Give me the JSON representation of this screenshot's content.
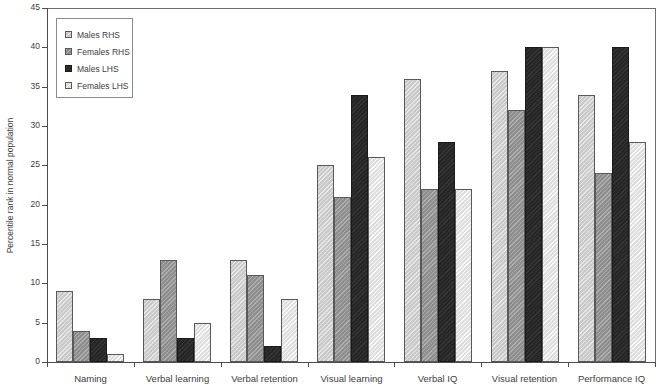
{
  "chart_data": {
    "type": "bar",
    "title": "",
    "subtitle": "",
    "xlabel": "",
    "ylabel": "Percentile rank in normal population",
    "ylim": [
      0,
      45
    ],
    "ytick_labels": [
      "0",
      "5",
      "10",
      "15",
      "20",
      "25",
      "30",
      "35",
      "40",
      "45"
    ],
    "ytick_values": [
      0,
      5,
      10,
      15,
      20,
      25,
      30,
      35,
      40,
      45
    ],
    "grid": false,
    "legend_position": "top-left",
    "categories": [
      "Naming",
      "Verbal learning",
      "Verbal retention",
      "Visual learning",
      "Verbal IQ",
      "Visual retention",
      "Performance IQ"
    ],
    "series": [
      {
        "name": "Males RHS",
        "color": "#c9c9c9",
        "values": [
          9,
          8,
          13,
          25,
          36,
          37,
          34
        ]
      },
      {
        "name": "Females RHS",
        "color": "#8d8d8d",
        "values": [
          4,
          13,
          11,
          21,
          22,
          32,
          24
        ]
      },
      {
        "name": "Males LHS",
        "color": "#262626",
        "values": [
          3,
          3,
          2,
          34,
          28,
          40,
          40
        ]
      },
      {
        "name": "Females LHS",
        "color": "#dedede",
        "values": [
          1,
          5,
          8,
          26,
          22,
          40,
          28
        ]
      }
    ],
    "legend": [
      "Males RHS",
      "Females RHS",
      "Males LHS",
      "Females LHS"
    ]
  }
}
